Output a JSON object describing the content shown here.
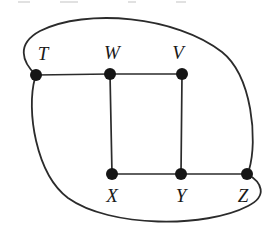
{
  "figure": {
    "type": "undirected-graph-diagram",
    "background_color": "#ffffff",
    "line_color": "#2b2b2b",
    "vertex_color": "#151515",
    "label_color": "#1a1a1a",
    "width": 272,
    "height": 236
  },
  "vertices": [
    {
      "id": "T",
      "label": "T",
      "x": 36,
      "y": 75,
      "label_x": 43,
      "label_y": 60,
      "row": "top"
    },
    {
      "id": "W",
      "label": "W",
      "x": 110,
      "y": 74,
      "label_x": 112,
      "label_y": 59,
      "row": "top"
    },
    {
      "id": "V",
      "label": "V",
      "x": 182,
      "y": 74,
      "label_x": 178,
      "label_y": 59,
      "row": "top"
    },
    {
      "id": "X",
      "label": "X",
      "x": 112,
      "y": 174,
      "label_x": 112,
      "label_y": 202,
      "row": "bottom"
    },
    {
      "id": "Y",
      "label": "Y",
      "x": 181,
      "y": 174,
      "label_x": 181,
      "label_y": 202,
      "row": "bottom"
    },
    {
      "id": "Z",
      "label": "Z",
      "x": 247,
      "y": 174,
      "label_x": 243,
      "label_y": 202,
      "row": "bottom"
    }
  ],
  "straight_edges": [
    {
      "from": "T",
      "to": "W",
      "x1": 36,
      "y1": 75,
      "x2": 110,
      "y2": 74
    },
    {
      "from": "W",
      "to": "V",
      "x1": 110,
      "y1": 74,
      "x2": 182,
      "y2": 74
    },
    {
      "from": "W",
      "to": "X",
      "x1": 110,
      "y1": 74,
      "x2": 112,
      "y2": 174
    },
    {
      "from": "V",
      "to": "Y",
      "x1": 182,
      "y1": 74,
      "x2": 181,
      "y2": 174
    },
    {
      "from": "X",
      "to": "Y",
      "x1": 112,
      "y1": 174,
      "x2": 181,
      "y2": 174
    },
    {
      "from": "Y",
      "to": "Z",
      "x1": 181,
      "y1": 174,
      "x2": 247,
      "y2": 174
    }
  ],
  "curved_edges": [
    {
      "from": "T",
      "to": "Z",
      "side": "upper",
      "path": "M 36 75 C 22 62 16 44 40 31 C 86 8 176 16 222 52 C 252 76 258 140 249 170"
    },
    {
      "from": "Z",
      "to": "T",
      "side": "lower",
      "path": "M 247 174 C 262 182 268 196 248 206 C 206 228 110 228 68 198 C 36 174 26 110 35 78"
    }
  ],
  "vertex_radius": 6,
  "top_crop_artifacts": [
    {
      "left": 18,
      "width": 12
    },
    {
      "left": 60,
      "width": 18
    },
    {
      "left": 128,
      "width": 8
    },
    {
      "left": 176,
      "width": 10
    }
  ]
}
